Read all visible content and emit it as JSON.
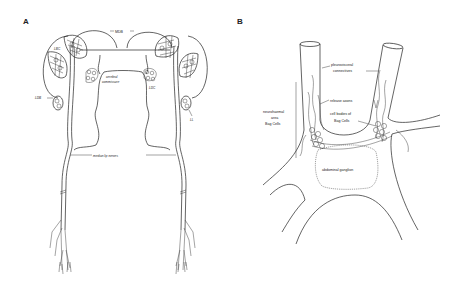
{
  "figure": {
    "panels": [
      {
        "id": "A",
        "label": "A",
        "labels": {
          "mdb": "MDB",
          "lbc": "LBC",
          "cerebral_commissure_1": "cerebral",
          "cerebral_commissure_2": "commissure",
          "ldb": "LDB",
          "ldc": "LDC",
          "ll": "LL",
          "median_lip_nerves": "median lip nerves"
        }
      },
      {
        "id": "B",
        "label": "B",
        "labels": {
          "pleurovisceral_1": "pleurovisceral",
          "pleurovisceral_2": "connectives",
          "release_axons": "release axons",
          "neurohaemal_1": "neurohaemal",
          "neurohaemal_2": "area",
          "neurohaemal_3": "Bag Cells",
          "cell_bodies_1": "cell bodies of",
          "cell_bodies_2": "Bag Cells",
          "abdominal_ganglion": "abdominal ganglion"
        }
      }
    ],
    "colors": {
      "line": "#222222",
      "background": "#ffffff"
    }
  }
}
